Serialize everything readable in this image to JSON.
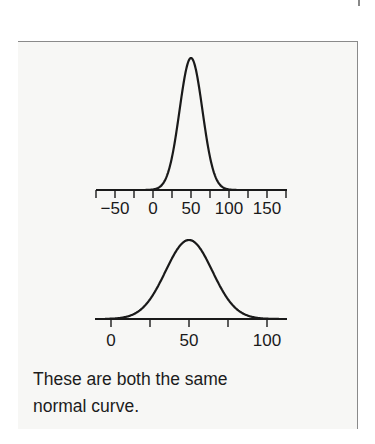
{
  "caption": {
    "line1": "These are both the same",
    "line2": "normal curve."
  },
  "chart_data": [
    {
      "type": "line",
      "title": "",
      "description": "Normal curve (mean 50, sd 15) drawn on a compressed x-axis",
      "mean": 50,
      "sd": 15,
      "xlabel": "",
      "ylabel": "",
      "xlim": [
        -75,
        175
      ],
      "ticks": [
        -75,
        -50,
        -25,
        0,
        25,
        50,
        75,
        100,
        125,
        150,
        175
      ],
      "tick_labels": [
        "-50",
        "0",
        "50",
        "100",
        "150"
      ],
      "tick_label_values": [
        -50,
        0,
        50,
        100,
        150
      ],
      "grid": false,
      "legend": null
    },
    {
      "type": "line",
      "title": "",
      "description": "Same normal curve (mean 50, sd 15) drawn on a stretched x-axis",
      "mean": 50,
      "sd": 15,
      "xlabel": "",
      "ylabel": "",
      "xlim": [
        -10,
        110
      ],
      "ticks": [
        0,
        25,
        50,
        75,
        100
      ],
      "tick_labels": [
        "0",
        "50",
        "100"
      ],
      "tick_label_values": [
        0,
        50,
        100
      ],
      "grid": false,
      "legend": null
    }
  ],
  "colors": {
    "curve": "#1a1a1a",
    "axis": "#1a1a1a",
    "panel_bg": "#f7f7f5",
    "border": "#8a8a8a"
  }
}
